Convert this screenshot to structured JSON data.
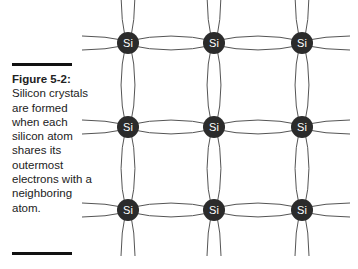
{
  "figure": {
    "label": "Figure 5-2:",
    "caption": "Silicon crystals are formed when each silicon atom shares its outermost electrons with a neighboring atom.",
    "atom_symbol": "Si",
    "lattice": {
      "columns_x": [
        128,
        214,
        302
      ],
      "rows_y": [
        43,
        127,
        210
      ],
      "atom_radius": 11,
      "atom_color": "#2b2b2b",
      "bond_color": "#555555"
    }
  }
}
